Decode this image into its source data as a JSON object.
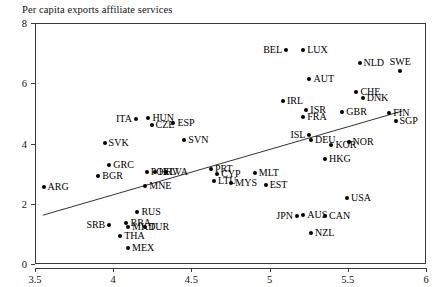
{
  "chart_data": {
    "type": "scatter",
    "title": "Per capita exports affiliate services",
    "xlabel": "",
    "ylabel": "",
    "xlim": [
      3.5,
      6.0
    ],
    "ylim": [
      0,
      8
    ],
    "xticks": [
      "3.5",
      "4",
      "4.5",
      "5",
      "5.5",
      "6"
    ],
    "xtick_values": [
      3.5,
      4,
      4.5,
      5,
      5.5,
      6
    ],
    "yticks": [
      "0",
      "2",
      "4",
      "6",
      "8"
    ],
    "ytick_values": [
      0,
      2,
      4,
      6,
      8
    ],
    "grid": false,
    "legend": "none",
    "marker_color": "#000000",
    "line_color": "#333333",
    "fit_line": {
      "type": "linear",
      "x_start": 3.55,
      "y_start": 1.62,
      "x_end": 5.85,
      "y_end": 5.08
    },
    "points": [
      {
        "label": "ARG",
        "x": 3.555,
        "y": 2.55,
        "lpos": "l"
      },
      {
        "label": "BGR",
        "x": 3.905,
        "y": 2.92,
        "lpos": "l"
      },
      {
        "label": "GRC",
        "x": 3.975,
        "y": 3.3,
        "lpos": "l"
      },
      {
        "label": "SVK",
        "x": 3.945,
        "y": 4.02,
        "lpos": "l"
      },
      {
        "label": "ITA",
        "x": 4.145,
        "y": 4.82,
        "lpos": "r"
      },
      {
        "label": "HUN",
        "x": 4.225,
        "y": 4.86,
        "lpos": "l"
      },
      {
        "label": "CZE",
        "x": 4.245,
        "y": 4.62,
        "lpos": "l"
      },
      {
        "label": "ESP",
        "x": 4.385,
        "y": 4.68,
        "lpos": "l"
      },
      {
        "label": "SVN",
        "x": 4.455,
        "y": 4.1,
        "lpos": "l"
      },
      {
        "label": "POL",
        "x": 4.215,
        "y": 3.06,
        "lpos": "l"
      },
      {
        "label": "HRV",
        "x": 4.265,
        "y": 3.06,
        "lpos": "l"
      },
      {
        "label": "LVA",
        "x": 4.335,
        "y": 3.04,
        "lpos": "l"
      },
      {
        "label": "MNE",
        "x": 4.205,
        "y": 2.58,
        "lpos": "l"
      },
      {
        "label": "PRT",
        "x": 4.625,
        "y": 3.14,
        "lpos": "l"
      },
      {
        "label": "CYP",
        "x": 4.665,
        "y": 2.98,
        "lpos": "l"
      },
      {
        "label": "LTU",
        "x": 4.645,
        "y": 2.76,
        "lpos": "l"
      },
      {
        "label": "MYS",
        "x": 4.755,
        "y": 2.7,
        "lpos": "l"
      },
      {
        "label": "MLT",
        "x": 4.905,
        "y": 3.02,
        "lpos": "l"
      },
      {
        "label": "EST",
        "x": 4.975,
        "y": 2.62,
        "lpos": "l"
      },
      {
        "label": "RUS",
        "x": 4.155,
        "y": 1.72,
        "lpos": "l"
      },
      {
        "label": "SRB",
        "x": 3.975,
        "y": 1.3,
        "lpos": "r"
      },
      {
        "label": "BRA",
        "x": 4.085,
        "y": 1.36,
        "lpos": "l"
      },
      {
        "label": "MKD",
        "x": 4.095,
        "y": 1.24,
        "lpos": "l"
      },
      {
        "label": "TUR",
        "x": 4.205,
        "y": 1.24,
        "lpos": "l"
      },
      {
        "label": "THA",
        "x": 4.045,
        "y": 0.92,
        "lpos": "l"
      },
      {
        "label": "MEX",
        "x": 4.095,
        "y": 0.52,
        "lpos": "l"
      },
      {
        "label": "JPN",
        "x": 5.175,
        "y": 1.6,
        "lpos": "r"
      },
      {
        "label": "AUS",
        "x": 5.215,
        "y": 1.62,
        "lpos": "l"
      },
      {
        "label": "CAN",
        "x": 5.355,
        "y": 1.6,
        "lpos": "l"
      },
      {
        "label": "NZL",
        "x": 5.265,
        "y": 1.02,
        "lpos": "l"
      },
      {
        "label": "USA",
        "x": 5.495,
        "y": 2.18,
        "lpos": "l"
      },
      {
        "label": "HKG",
        "x": 5.355,
        "y": 3.48,
        "lpos": "l"
      },
      {
        "label": "KOR",
        "x": 5.395,
        "y": 3.96,
        "lpos": "l"
      },
      {
        "label": "NOR",
        "x": 5.505,
        "y": 4.06,
        "lpos": "l"
      },
      {
        "label": "DEU",
        "x": 5.265,
        "y": 4.12,
        "lpos": "l"
      },
      {
        "label": "ISL",
        "x": 5.255,
        "y": 4.28,
        "lpos": "r"
      },
      {
        "label": "ISR",
        "x": 5.235,
        "y": 5.1,
        "lpos": "l"
      },
      {
        "label": "FRA",
        "x": 5.215,
        "y": 4.88,
        "lpos": "l"
      },
      {
        "label": "IRL",
        "x": 5.085,
        "y": 5.42,
        "lpos": "l"
      },
      {
        "label": "GBR",
        "x": 5.465,
        "y": 5.04,
        "lpos": "l"
      },
      {
        "label": "CHE",
        "x": 5.555,
        "y": 5.72,
        "lpos": "l"
      },
      {
        "label": "DNK",
        "x": 5.595,
        "y": 5.52,
        "lpos": "l"
      },
      {
        "label": "FIN",
        "x": 5.765,
        "y": 5.02,
        "lpos": "l"
      },
      {
        "label": "SGP",
        "x": 5.805,
        "y": 4.76,
        "lpos": "l"
      },
      {
        "label": "AUT",
        "x": 5.255,
        "y": 6.14,
        "lpos": "l"
      },
      {
        "label": "NLD",
        "x": 5.575,
        "y": 6.68,
        "lpos": "l"
      },
      {
        "label": "SWE",
        "x": 5.835,
        "y": 6.4,
        "lpos": "t"
      },
      {
        "label": "BEL",
        "x": 5.105,
        "y": 7.1,
        "lpos": "r"
      },
      {
        "label": "LUX",
        "x": 5.215,
        "y": 7.1,
        "lpos": "l"
      }
    ]
  }
}
